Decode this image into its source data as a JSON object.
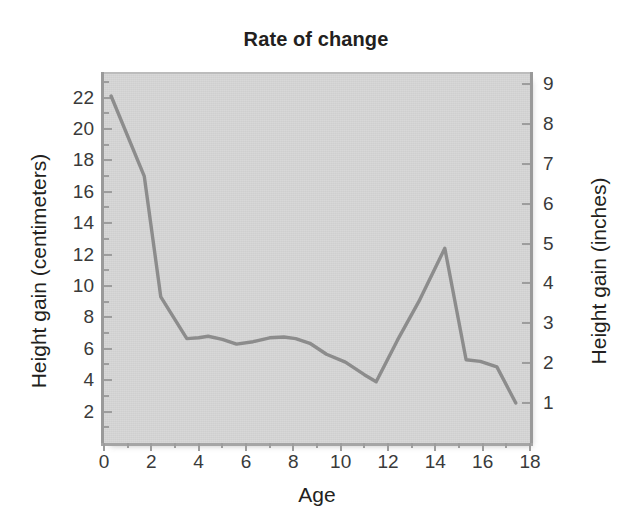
{
  "chart_data": {
    "type": "line",
    "title": "Rate of change",
    "xlabel": "Age",
    "ylabel": "Height gain (centimeters)",
    "ylabel_secondary": "Height gain (inches)",
    "xlim": [
      0,
      18
    ],
    "ylim": [
      0,
      23.5
    ],
    "ylim_secondary": [
      0,
      9.25
    ],
    "grid": false,
    "legend": "none",
    "background_color": "#d6d6d6",
    "line_color": "#8c8c8c",
    "xticks": [
      0,
      2,
      4,
      6,
      8,
      10,
      12,
      14,
      16,
      18
    ],
    "xticks_minor": [
      1,
      3,
      5,
      7,
      9,
      11,
      13,
      15,
      17
    ],
    "yticks": [
      2,
      4,
      6,
      8,
      10,
      12,
      14,
      16,
      18,
      20,
      22
    ],
    "yticks_secondary": [
      1,
      2,
      3,
      4,
      5,
      6,
      7,
      8,
      9
    ],
    "series": [
      {
        "name": "Height gain per year",
        "x": [
          0.3,
          1.7,
          2.4,
          3.5,
          4.0,
          4.4,
          5.0,
          5.6,
          6.3,
          7.0,
          7.6,
          8.1,
          8.7,
          9.4,
          10.2,
          11.0,
          11.5,
          12.4,
          13.3,
          14.4,
          15.3,
          15.9,
          16.6,
          17.4
        ],
        "values": [
          22.1,
          17.0,
          9.3,
          6.65,
          6.7,
          6.8,
          6.6,
          6.3,
          6.45,
          6.7,
          6.75,
          6.65,
          6.35,
          5.65,
          5.15,
          4.35,
          3.9,
          6.55,
          9.0,
          12.4,
          5.3,
          5.2,
          4.85,
          2.55
        ]
      }
    ]
  },
  "axis_titles": {
    "left": "Height gain (centimeters)",
    "right": "Height gain (inches)",
    "bottom": "Age"
  },
  "title": "Rate of change"
}
